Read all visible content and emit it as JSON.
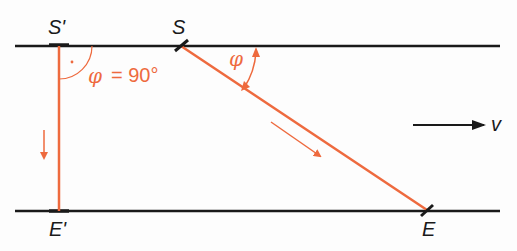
{
  "diagram": {
    "colors": {
      "line": "#1a1a1a",
      "accent": "#ee6a3e",
      "background": "#fdfdfd"
    },
    "labels": {
      "s_prime": "S'",
      "s": "S",
      "e_prime": "E'",
      "e": "E",
      "v": "v",
      "phi": "φ",
      "phi_equation_symbol": "φ",
      "phi_equation_value": "= 90°"
    },
    "elements": [
      {
        "name": "top-bank-line",
        "from": [
          45,
          45
        ],
        "to": [
          505,
          45
        ]
      },
      {
        "name": "bottom-bank-line",
        "from": [
          45,
          211
        ],
        "to": [
          505,
          211
        ]
      },
      {
        "name": "perpendicular-path",
        "from": [
          58,
          45
        ],
        "to": [
          58,
          211
        ]
      },
      {
        "name": "diagonal-path",
        "from": [
          180,
          45
        ],
        "to": [
          428,
          211
        ]
      },
      {
        "name": "flow-velocity-arrow",
        "from": [
          413,
          125
        ],
        "to": [
          485,
          125
        ]
      }
    ]
  }
}
